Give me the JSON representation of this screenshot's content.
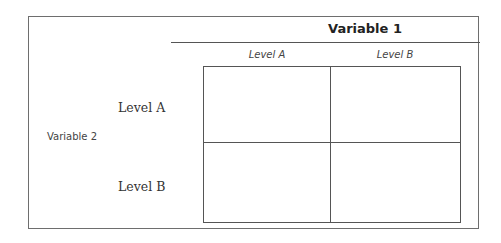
{
  "diagram": {
    "variable1": {
      "label": "Variable 1",
      "levels": [
        "Level A",
        "Level B"
      ]
    },
    "variable2": {
      "label": "Variable 2",
      "levels": [
        "Level A",
        "Level B"
      ]
    },
    "cells": [
      [
        "",
        ""
      ],
      [
        "",
        ""
      ]
    ],
    "colors": {
      "border": "#555555",
      "text": "#333333",
      "background": "#ffffff"
    }
  }
}
